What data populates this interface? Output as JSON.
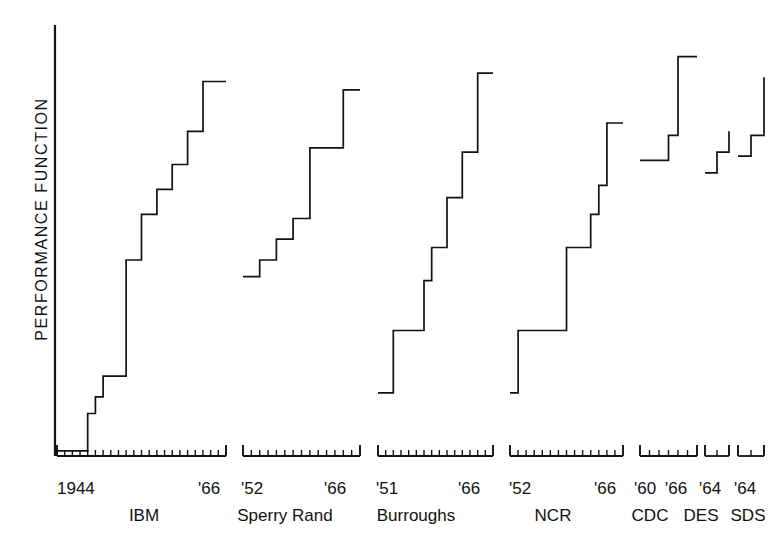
{
  "figure": {
    "y_axis_title": "PERFORMANCE FUNCTION",
    "caption_fragment": ""
  },
  "chart_data": {
    "type": "line",
    "title": "",
    "xlabel": "",
    "ylabel": "PERFORMANCE FUNCTION",
    "grid": false,
    "legend": "none",
    "note": "Seven separate step (staircase) plots, one per computer manufacturer, each with its own year axis segment. Y axis is an unlabelled qualitative 'performance function' scale with no tick values.",
    "ylim": [
      0,
      100
    ],
    "panels": [
      {
        "name": "IBM",
        "company_label": "IBM",
        "axis_start_label": "1944",
        "axis_end_label": "'66",
        "year_start": 1944,
        "year_end": 1966,
        "tick_count": 23,
        "steps": [
          {
            "year": 1944,
            "value": 1
          },
          {
            "year": 1948,
            "value": 10
          },
          {
            "year": 1949,
            "value": 14
          },
          {
            "year": 1950,
            "value": 19
          },
          {
            "year": 1953,
            "value": 47
          },
          {
            "year": 1955,
            "value": 58
          },
          {
            "year": 1957,
            "value": 64
          },
          {
            "year": 1959,
            "value": 70
          },
          {
            "year": 1961,
            "value": 78
          },
          {
            "year": 1963,
            "value": 90
          }
        ]
      },
      {
        "name": "Sperry Rand",
        "company_label": "Sperry Rand",
        "axis_start_label": "'52",
        "axis_end_label": "'66",
        "year_start": 1952,
        "year_end": 1966,
        "tick_count": 15,
        "steps": [
          {
            "year": 1952,
            "value": 43
          },
          {
            "year": 1954,
            "value": 47
          },
          {
            "year": 1956,
            "value": 52
          },
          {
            "year": 1958,
            "value": 57
          },
          {
            "year": 1960,
            "value": 74
          },
          {
            "year": 1964,
            "value": 88
          }
        ]
      },
      {
        "name": "Burroughs",
        "company_label": "Burroughs",
        "axis_start_label": "'51",
        "axis_end_label": "'66",
        "year_start": 1951,
        "year_end": 1966,
        "tick_count": 16,
        "steps": [
          {
            "year": 1951,
            "value": 15
          },
          {
            "year": 1953,
            "value": 30
          },
          {
            "year": 1957,
            "value": 42
          },
          {
            "year": 1958,
            "value": 50
          },
          {
            "year": 1960,
            "value": 62
          },
          {
            "year": 1962,
            "value": 73
          },
          {
            "year": 1964,
            "value": 92
          }
        ]
      },
      {
        "name": "NCR",
        "company_label": "NCR",
        "axis_start_label": "'52",
        "axis_end_label": "'66",
        "year_start": 1952,
        "year_end": 1966,
        "tick_count": 15,
        "steps": [
          {
            "year": 1952,
            "value": 15
          },
          {
            "year": 1953,
            "value": 30
          },
          {
            "year": 1959,
            "value": 50
          },
          {
            "year": 1962,
            "value": 58
          },
          {
            "year": 1963,
            "value": 65
          },
          {
            "year": 1964,
            "value": 80
          }
        ]
      },
      {
        "name": "CDC",
        "company_label": "CDC",
        "axis_start_label": "'60",
        "axis_end_label": "'66",
        "year_start": 1960,
        "year_end": 1966,
        "tick_count": 7,
        "steps": [
          {
            "year": 1960,
            "value": 71
          },
          {
            "year": 1963,
            "value": 77
          },
          {
            "year": 1964,
            "value": 96
          }
        ]
      },
      {
        "name": "DES",
        "company_label": "DES",
        "axis_start_label": "'64",
        "axis_end_label": "",
        "year_start": 1964,
        "year_end": 1966,
        "tick_count": 3,
        "steps": [
          {
            "year": 1964,
            "value": 68
          },
          {
            "year": 1965,
            "value": 73
          },
          {
            "year": 1966,
            "value": 78
          }
        ]
      },
      {
        "name": "SDS",
        "company_label": "SDS",
        "axis_start_label": "'64",
        "axis_end_label": "",
        "year_start": 1964,
        "year_end": 1966,
        "tick_count": 3,
        "steps": [
          {
            "year": 1964,
            "value": 72
          },
          {
            "year": 1965,
            "value": 77
          },
          {
            "year": 1966,
            "value": 91
          }
        ]
      }
    ]
  },
  "axis_labels": {
    "ibm_start": "1944",
    "ibm_end": "'66",
    "sperry_start": "'52",
    "sperry_end": "'66",
    "burroughs_start": "'51",
    "burroughs_end": "'66",
    "ncr_start": "'52",
    "ncr_end": "'66",
    "cdc_start": "'60",
    "cdc_end": "'66",
    "des_start": "'64",
    "sds_start": "'64"
  },
  "company_labels": {
    "ibm": "IBM",
    "sperry": "Sperry Rand",
    "burroughs": "Burroughs",
    "ncr": "NCR",
    "cdc": "CDC",
    "des": "DES",
    "sds": "SDS"
  },
  "colors": {
    "ink": "#111111",
    "background": "#ffffff"
  }
}
